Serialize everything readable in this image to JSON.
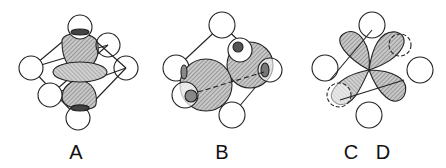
{
  "figure": {
    "panels": [
      {
        "id": "A",
        "label": "A",
        "description": "d orbital with two lobes along vertical axis and torus ring, octahedral ligand spheres"
      },
      {
        "id": "B",
        "label": "B",
        "description": "d orbital lobes directed between ligand positions, octahedral ligand spheres"
      },
      {
        "id": "CDE",
        "label": "C D E",
        "description": "four-lobed cloverleaf d orbital in octahedral ligand field"
      }
    ],
    "colors": {
      "line": "#222222",
      "shade": "#9a9a9a",
      "dark": "#555555",
      "background": "#ffffff"
    }
  }
}
